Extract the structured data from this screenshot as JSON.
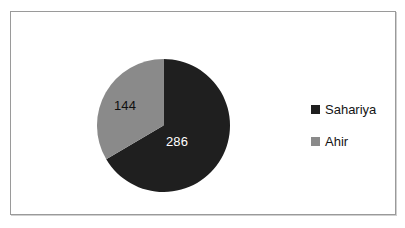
{
  "chart_data": {
    "type": "pie",
    "title": "",
    "subtitle": "",
    "xlabel": "",
    "ylabel": "",
    "grid": false,
    "legend_position": "right",
    "total": 430,
    "start_angle_deg": 0,
    "direction": "clockwise",
    "categories": [
      "Sahariya",
      "Ahir"
    ],
    "values": [
      286,
      144
    ],
    "slices": [
      {
        "label": "Sahariya",
        "value": 286,
        "value_text": "286",
        "percent": 66.5,
        "angle_deg": 239.4,
        "color": "#1f1f1f",
        "label_color": "#ffffff"
      },
      {
        "label": "Ahir",
        "value": 144,
        "value_text": "144",
        "percent": 33.5,
        "angle_deg": 120.6,
        "color": "#8a8a8a",
        "label_color": "#101010"
      }
    ]
  },
  "legend": {
    "items": [
      {
        "label": "Sahariya",
        "color": "#1f1f1f"
      },
      {
        "label": "Ahir",
        "color": "#8a8a8a"
      }
    ]
  },
  "colors": {
    "sahariya": "#1f1f1f",
    "ahir": "#8a8a8a",
    "frame": "#9a9a9a",
    "background": "#ffffff"
  }
}
